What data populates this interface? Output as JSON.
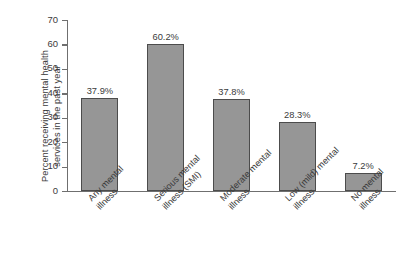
{
  "chart_data": {
    "type": "bar",
    "title": "",
    "subtitle": "",
    "xlabel": "",
    "ylabel": "Percent receiving mental health services in the past year",
    "ylabel_lines": [
      "Percent receiving mental health",
      "services in the past year"
    ],
    "categories": [
      "Any mental illness",
      "Serious mental illness (SMI)",
      "Moderate mental illness",
      "Low (mild) mental illness",
      "No mental illness"
    ],
    "category_lines": [
      [
        "Any mental",
        "illness"
      ],
      [
        "Serious mental",
        "illness (SMI)"
      ],
      [
        "Moderate mental",
        "illness"
      ],
      [
        "Low (mild) mental",
        "illness"
      ],
      [
        "No mental",
        "illness"
      ]
    ],
    "values": [
      37.9,
      60.2,
      37.8,
      28.3,
      7.2
    ],
    "data_labels": [
      "37.9%",
      "60.2%",
      "37.8%",
      "28.3%",
      "7.2%"
    ],
    "ylim": [
      0,
      70
    ],
    "ytick_values": [
      0,
      10,
      20,
      30,
      40,
      50,
      60,
      70
    ],
    "ytick_labels": [
      "0",
      "10",
      "20",
      "30",
      "40",
      "50",
      "60",
      "70"
    ],
    "grid": false,
    "legend": false,
    "legend_position": "none",
    "bar_color": "#969696",
    "bar_edge_color": "#4c4c4c",
    "axis_color": "#6f6f6f",
    "text_color": "#3b3b3b",
    "background_color": "#ffffff",
    "xlabel_rotation_deg": -45
  },
  "artifact": {
    "margin_text": ""
  }
}
